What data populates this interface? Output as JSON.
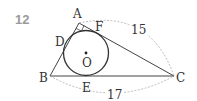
{
  "problem": {
    "number": "12"
  },
  "figure": {
    "points": {
      "A": "A",
      "B": "B",
      "C": "C",
      "D": "D",
      "E": "E",
      "F": "F",
      "O": "O"
    },
    "lengths": {
      "AC": "15",
      "BC": "17"
    },
    "colors": {
      "line": "#444444",
      "dashed": "#aaaaaa",
      "number": "#9a9a9a"
    }
  }
}
